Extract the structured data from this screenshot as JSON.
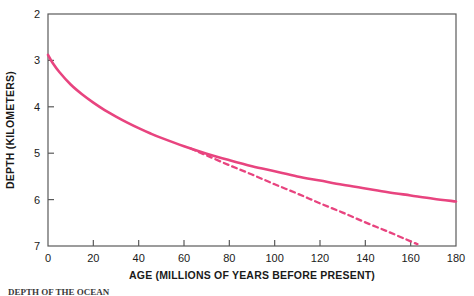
{
  "figure": {
    "background_color": "#ffffff",
    "frame_color": "#5a5a5a",
    "caption_cut_off": "DEPTH OF THE OCEAN"
  },
  "chart_data": {
    "type": "line",
    "title": "",
    "xlabel": "AGE (MILLIONS OF YEARS BEFORE PRESENT)",
    "ylabel": "DEPTH (KILOMETERS)",
    "xlim": [
      0,
      180
    ],
    "ylim": [
      2,
      7
    ],
    "y_axis_inverted": true,
    "grid": false,
    "legend_position": "none",
    "xticks": [
      0,
      20,
      40,
      60,
      80,
      100,
      120,
      140,
      160,
      180
    ],
    "yticks": [
      2,
      3,
      4,
      5,
      6,
      7
    ],
    "xtick_labels": [
      "0",
      "20",
      "40",
      "60",
      "80",
      "100",
      "120",
      "140",
      "160",
      "180"
    ],
    "ytick_labels": [
      "2",
      "3",
      "4",
      "5",
      "6",
      "7"
    ],
    "series": [
      {
        "name": "observed-depth-curve",
        "style": "solid",
        "color": "#e8447f",
        "line_width": 2.6,
        "x": [
          0,
          2,
          5,
          10,
          15,
          20,
          25,
          30,
          35,
          40,
          45,
          50,
          60,
          70,
          80,
          90,
          100,
          110,
          120,
          130,
          140,
          150,
          160,
          170,
          180
        ],
        "y": [
          2.88,
          3.05,
          3.25,
          3.52,
          3.73,
          3.91,
          4.07,
          4.21,
          4.34,
          4.46,
          4.57,
          4.67,
          4.85,
          5.01,
          5.15,
          5.28,
          5.39,
          5.5,
          5.59,
          5.68,
          5.76,
          5.84,
          5.91,
          5.98,
          6.04
        ]
      },
      {
        "name": "theoretical-cooling-curve",
        "style": "dashed",
        "color": "#e8447f",
        "line_width": 2.3,
        "dash_pattern": "5,4",
        "x": [
          63,
          70,
          80,
          90,
          100,
          110,
          120,
          130,
          140,
          150,
          160,
          163
        ],
        "y": [
          4.9,
          5.05,
          5.26,
          5.46,
          5.67,
          5.87,
          6.08,
          6.28,
          6.49,
          6.69,
          6.9,
          6.96
        ]
      }
    ]
  },
  "axes": {
    "x_title": "AGE (MILLIONS OF YEARS BEFORE PRESENT)",
    "y_title": "DEPTH (KILOMETERS)"
  }
}
